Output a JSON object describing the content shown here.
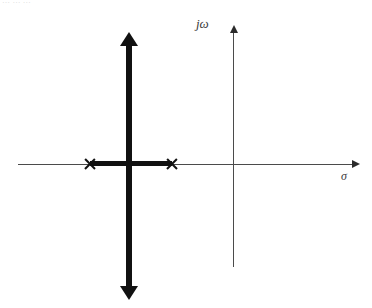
{
  "figure": {
    "type": "root-locus-plot",
    "clipped_header_text": "… … …",
    "axes": {
      "imaginary": {
        "label": "jω",
        "icon": "up-arrow-axis-icon",
        "color": "#4b4b4b"
      },
      "real": {
        "label": "σ",
        "icon": "right-arrow-axis-icon",
        "color": "#4b4b4b"
      }
    },
    "locus": {
      "color": "#111111",
      "vertical_branch": {
        "name": "asymptote-branch",
        "arrow_up_icon": "arrowhead-up-icon",
        "arrow_down_icon": "arrowhead-down-icon"
      },
      "real_axis_segment": {
        "name": "real-axis-locus-segment"
      }
    },
    "poles": [
      {
        "marker": "x",
        "name": "pole-left"
      },
      {
        "marker": "x",
        "name": "pole-right"
      }
    ]
  }
}
